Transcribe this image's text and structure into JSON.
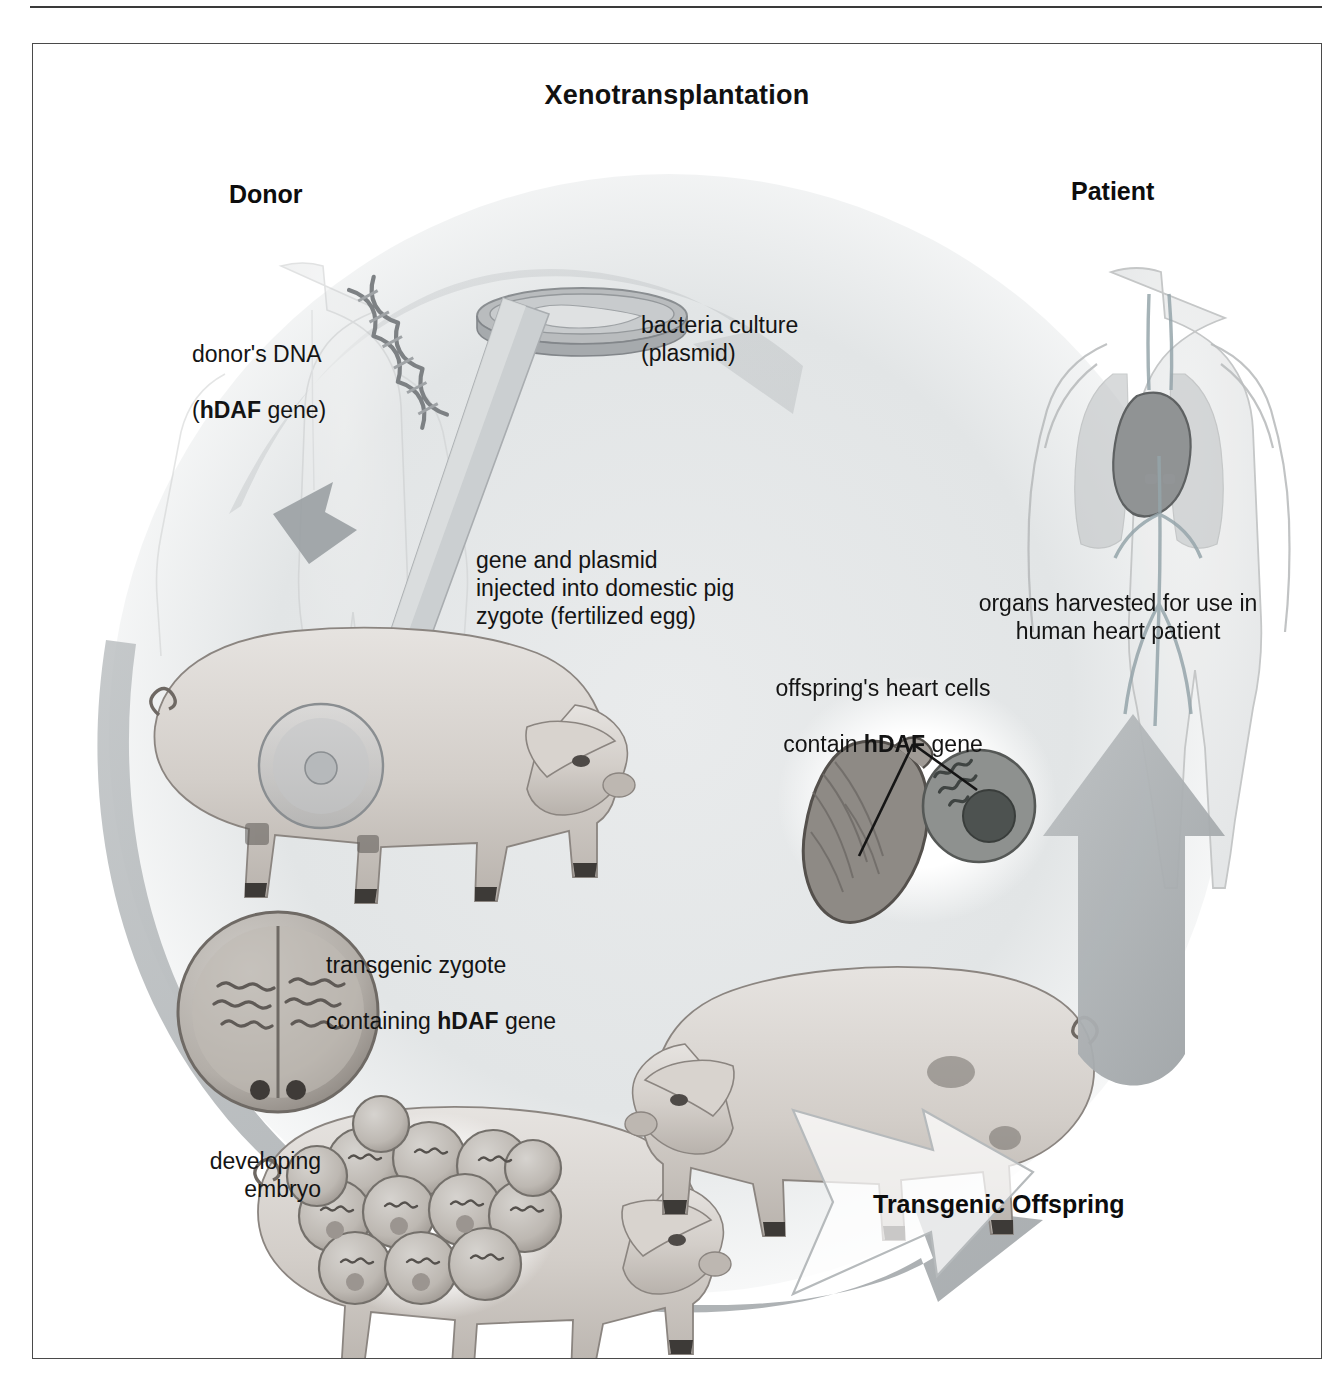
{
  "figure": {
    "title": "Xenotransplantation",
    "accent_gray": "#b9bcbe",
    "arrow_gray": "#a9adb0",
    "ink": "#141414"
  },
  "headings": {
    "donor": "Donor",
    "patient": "Patient",
    "transgenic_offspring": "Transgenic Offspring"
  },
  "labels": {
    "donor_dna_line1": "donor's DNA",
    "donor_dna_bold": "hDAF",
    "donor_dna_line2_tail": " gene)",
    "donor_dna_line2_head": "(",
    "bacteria_culture": "bacteria culture\n(plasmid)",
    "injection": "gene and plasmid\ninjected into domestic pig\nzygote (fertilized egg)",
    "transgenic_zygote_line1": "transgenic zygote",
    "transgenic_zygote_line2_head": "containing ",
    "transgenic_zygote_bold": "hDAF",
    "transgenic_zygote_line2_tail": " gene",
    "developing_embryo": "developing\nembryo",
    "heart_cells_line1": "offspring's heart cells",
    "heart_cells_line2_head": "contain ",
    "heart_cells_bold": "hDAF",
    "heart_cells_line2_tail": " gene",
    "organs_harvested": "organs harvested for use in\nhuman heart patient"
  },
  "icons": {
    "donor_figure": "human-torso-icon",
    "patient_figure": "human-torso-heart-icon",
    "dna": "dna-helix-icon",
    "petri_dish": "petri-dish-icon",
    "pipette": "micropipette-icon",
    "zygote": "zygote-cell-icon",
    "dividing_zygote": "dividing-zygote-icon",
    "embryo_cluster": "embryo-cell-cluster-icon",
    "pig_adult": "pig-icon",
    "pig_offspring": "piglet-icon",
    "heart": "heart-icon",
    "heart_cell": "cell-nucleus-icon",
    "cycle_arrow": "cycle-arrow-icon",
    "up_arrow": "up-arrow-icon",
    "outline_arrow": "outline-arrow-icon"
  }
}
